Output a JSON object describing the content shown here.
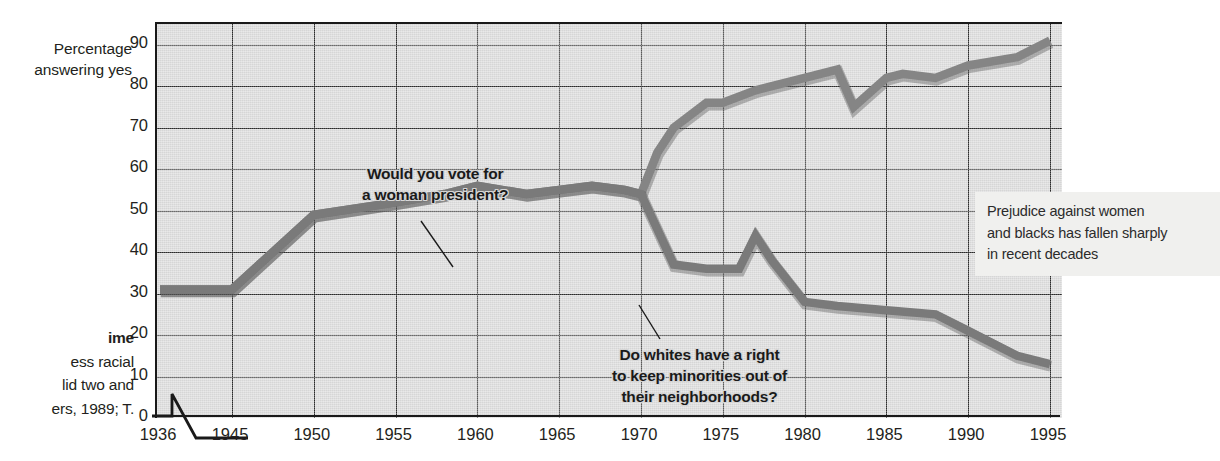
{
  "axis_title": {
    "line1": "Percentage",
    "line2": "answering yes"
  },
  "caption": {
    "line1": "ime",
    "line2": "ess racial",
    "line3": "lid two and",
    "line4": "ers, 1989; T."
  },
  "annotations": {
    "women": {
      "line1": "Would you vote for",
      "line2": "a woman president?"
    },
    "whites": {
      "line1": "Do whites have a right",
      "line2": "to keep minorities out of",
      "line3": "their neighborhoods?"
    },
    "callout": {
      "line1": "Prejudice against women",
      "line2": "and blacks has fallen sharply",
      "line3": "in recent decades"
    }
  },
  "colors": {
    "plot_background": "#d6d6d6",
    "gridline": "#2b2b2b",
    "axis": "#1a1a1a",
    "series_women": "#858585",
    "series_whites": "#7a7a7a",
    "callout_background": "#f0f0ee",
    "text": "#231f20"
  },
  "chart_data": {
    "type": "line",
    "title": "",
    "xlabel": "",
    "ylabel": "Percentage answering yes",
    "grid": true,
    "legend": "none (inline annotations)",
    "xlim": [
      1936,
      1996
    ],
    "ylim": [
      0,
      95
    ],
    "yticks": [
      0,
      10,
      20,
      30,
      40,
      50,
      60,
      70,
      80,
      90
    ],
    "xticks": [
      1936,
      1945,
      1950,
      1955,
      1960,
      1965,
      1970,
      1975,
      1980,
      1985,
      1990,
      1995
    ],
    "axis_break": "between 1936 and 1945",
    "series": [
      {
        "name": "Would you vote for a woman president?",
        "color": "#858585",
        "x": [
          1936,
          1945,
          1950,
          1955,
          1958,
          1960,
          1963,
          1965,
          1967,
          1969,
          1970,
          1971,
          1972,
          1974,
          1975,
          1977,
          1978,
          1980,
          1982,
          1983,
          1985,
          1986,
          1988,
          1990,
          1993,
          1995
        ],
        "values": [
          31,
          31,
          49,
          52,
          54,
          56,
          54,
          55,
          56,
          55,
          54,
          64,
          70,
          76,
          76,
          79,
          80,
          82,
          84,
          75,
          82,
          83,
          82,
          85,
          87,
          91
        ]
      },
      {
        "name": "Do whites have a right to keep minorities out of their neighborhoods?",
        "color": "#7a7a7a",
        "x": [
          1936,
          1945,
          1950,
          1955,
          1958,
          1960,
          1963,
          1965,
          1967,
          1969,
          1970,
          1972,
          1974,
          1976,
          1977,
          1978,
          1980,
          1982,
          1985,
          1988,
          1990,
          1993,
          1995
        ],
        "values": [
          31,
          31,
          49,
          52,
          54,
          56,
          54,
          55,
          56,
          55,
          54,
          37,
          36,
          36,
          44,
          38,
          28,
          27,
          26,
          25,
          21,
          15,
          13
        ]
      }
    ]
  }
}
